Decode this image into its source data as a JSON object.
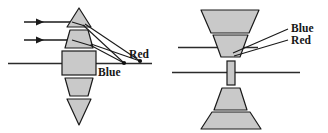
{
  "figure": {
    "background_color": "#ffffff",
    "glass_fill": "#c9c9c9",
    "glass_stroke": "#1a1a1a",
    "ray_color": "#1a1a1a",
    "axis_color": "#2a2a2a",
    "label_color": "#161616"
  },
  "left_panel": {
    "name": "segmented-lens-side-view",
    "labels": {
      "red": "Red",
      "blue": "Blue"
    },
    "focal_points": [
      {
        "name": "blue-focus",
        "label": "Blue",
        "x": 124,
        "y": 63
      },
      {
        "name": "red-focus",
        "label": "Red",
        "x": 140,
        "y": 61
      }
    ],
    "incident_rays": [
      {
        "name": "ray-top",
        "y": 22,
        "x_start": 23,
        "x_end": 71
      },
      {
        "name": "ray-middle",
        "y": 40,
        "x_start": 23,
        "x_end": 71
      }
    ],
    "optical_axis": {
      "y": 63,
      "x_start": 8,
      "x_end": 152
    },
    "segments": [
      {
        "name": "segment-1-prism-top",
        "shape": "triangle-up"
      },
      {
        "name": "segment-2-prism",
        "shape": "trapezoid-up"
      },
      {
        "name": "segment-3-slab",
        "shape": "rectangle"
      },
      {
        "name": "segment-4-prism",
        "shape": "trapezoid-down"
      },
      {
        "name": "segment-5-prism-bottom",
        "shape": "triangle-down"
      }
    ]
  },
  "right_panel": {
    "name": "segmented-lens-rotated-view",
    "labels": {
      "blue": "Blue",
      "red": "Red"
    },
    "leader_lines": [
      {
        "name": "blue-leader",
        "label": "Blue"
      },
      {
        "name": "red-leader",
        "label": "Red"
      }
    ],
    "upper_axis": {
      "y": 47,
      "x_start": 178,
      "x_end": 262
    },
    "optical_axis": {
      "y": 72,
      "x_start": 172,
      "x_end": 300
    },
    "segments": [
      {
        "name": "segment-1-wide-top",
        "shape": "trapezoid"
      },
      {
        "name": "segment-2-top",
        "shape": "trapezoid"
      },
      {
        "name": "segment-3-center-slab",
        "shape": "narrow-rectangle"
      },
      {
        "name": "segment-4-bottom",
        "shape": "trapezoid"
      },
      {
        "name": "segment-5-wide-bottom",
        "shape": "trapezoid"
      }
    ]
  }
}
